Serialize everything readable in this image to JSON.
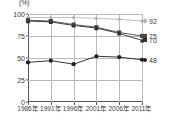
{
  "chart_data": {
    "type": "line",
    "title": "",
    "xlabel": "",
    "ylabel": "",
    "unit_label": "(%)",
    "ylim": [
      0,
      100
    ],
    "grid": true,
    "legend_position": "right-edge-value-labels",
    "categories": [
      "1986年",
      "1991年",
      "1996年",
      "2001年",
      "2006年",
      "2011年"
    ],
    "yticks": [
      0,
      25,
      50,
      75,
      100
    ],
    "ytick_labels": [
      "0",
      "25",
      "50",
      "75",
      "100"
    ],
    "series": [
      {
        "name": "series-92",
        "values": [
          96,
          96,
          96,
          95,
          94,
          92
        ],
        "end_value": 92,
        "end_label": "92",
        "color": "#b5b5b5",
        "marker": "diamond"
      },
      {
        "name": "series-75",
        "values": [
          93,
          92,
          88,
          85,
          79,
          75
        ],
        "end_value": 75,
        "end_label": "75",
        "color": "#4a4a4a",
        "marker": "square"
      },
      {
        "name": "series-70",
        "values": [
          92,
          91,
          87,
          84,
          78,
          70
        ],
        "end_value": 70,
        "end_label": "70",
        "color": "#2f2f2f",
        "marker": "triangle"
      },
      {
        "name": "series-48",
        "values": [
          45,
          47,
          43,
          52,
          51,
          48
        ],
        "end_value": 48,
        "end_label": "48",
        "color": "#1f1f1f",
        "marker": "circle"
      }
    ]
  }
}
